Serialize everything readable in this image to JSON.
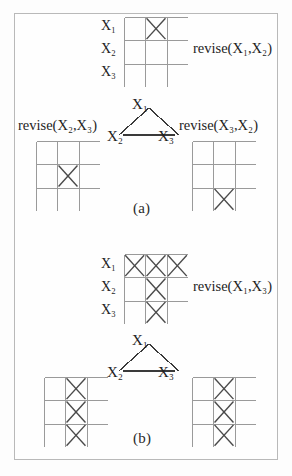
{
  "figure": {
    "background_color": "#fdfdfd",
    "border_color": "#b9b9b9",
    "grid_line_color": "#9a9a9a",
    "cross_color": "#4a4a4a",
    "edge_color": "#3a3a3a"
  },
  "panel_a": {
    "caption": "(a)",
    "top_grid": {
      "row_labels": [
        "X₁",
        "X₂",
        "X₃"
      ],
      "rows": 3,
      "cols": 3,
      "crosses": [
        [
          0,
          1
        ]
      ]
    },
    "top_label": "revise(X₁,X₂)",
    "left_label": "revise(X₂,X₃)",
    "right_label": "revise(X₃,X₂)",
    "graph": {
      "nodes": [
        "X₁",
        "X₂",
        "X₃"
      ],
      "edges": [
        [
          "X₁",
          "X₂"
        ],
        [
          "X₁",
          "X₃"
        ],
        [
          "X₂",
          "X₃"
        ]
      ]
    },
    "left_grid": {
      "rows": 3,
      "cols": 3,
      "crosses": [
        [
          1,
          1
        ]
      ]
    },
    "right_grid": {
      "rows": 3,
      "cols": 3,
      "crosses": [
        [
          2,
          1
        ]
      ]
    }
  },
  "panel_b": {
    "caption": "(b)",
    "top_grid": {
      "row_labels": [
        "X₁",
        "X₂",
        "X₃"
      ],
      "rows": 3,
      "cols": 3,
      "crosses": [
        [
          0,
          0
        ],
        [
          0,
          1
        ],
        [
          0,
          2
        ],
        [
          1,
          1
        ],
        [
          2,
          1
        ]
      ]
    },
    "top_label": "revise(X₁,X₃)",
    "graph": {
      "nodes": [
        "X₁",
        "X₂",
        "X₃"
      ],
      "edges": [
        [
          "X₁",
          "X₂"
        ],
        [
          "X₁",
          "X₃"
        ],
        [
          "X₂",
          "X₃"
        ]
      ]
    },
    "left_grid": {
      "rows": 3,
      "cols": 3,
      "crosses": [
        [
          0,
          1
        ],
        [
          1,
          1
        ],
        [
          2,
          1
        ]
      ]
    },
    "right_grid": {
      "rows": 3,
      "cols": 3,
      "crosses": [
        [
          0,
          1
        ],
        [
          1,
          1
        ],
        [
          2,
          1
        ]
      ]
    }
  },
  "labels": {
    "a_x1": "X₁",
    "a_x2": "X₂",
    "a_x3": "X₃",
    "b_x1": "X₁",
    "b_x2": "X₂",
    "b_x3": "X₃",
    "a_grid_r1": "X₁",
    "a_grid_r2": "X₂",
    "a_grid_r3": "X₃",
    "b_grid_r1": "X₁",
    "b_grid_r2": "X₂",
    "b_grid_r3": "X₃"
  }
}
